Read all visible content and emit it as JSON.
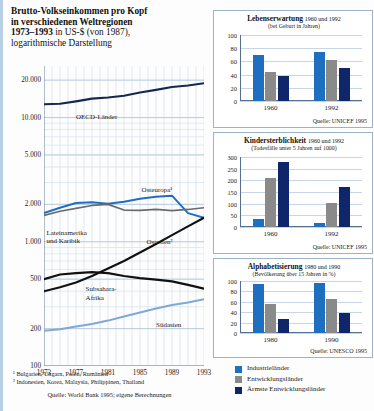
{
  "title": {
    "line1": "Brutto-Volkseinkommen pro Kopf",
    "line2": "in verschiedenen Weltregionen",
    "line3_bold": "1973–1993",
    "line3_rest": " in US-$ (von 1987),",
    "line4": "logarithmische Darstellung"
  },
  "colors": {
    "industrial": "#1f6fc0",
    "developing": "#8a8a8a",
    "poorest": "#10266b",
    "oecd_line": "#16284f",
    "osteuropa_line": "#1f6fc0",
    "ostasien_line": "#111111",
    "lateinamerika_line": "#6b6b6b",
    "subsahara_line": "#111111",
    "suedasien_line": "#7fa8d4",
    "grid": "#c6d6e6",
    "panel_border": "#9bb4cc"
  },
  "main_chart": {
    "type": "line",
    "log_scale": true,
    "ylabel": "",
    "xlabel": "",
    "yticks": [
      "20.000",
      "10.000",
      "5.000",
      "2.000",
      "1.000",
      "500",
      "200",
      "100"
    ],
    "ytick_values": [
      20000,
      10000,
      5000,
      2000,
      1000,
      500,
      200,
      100
    ],
    "ylim": [
      100,
      26000
    ],
    "xticks": [
      "1973",
      "1977",
      "1981",
      "1985",
      "1989",
      "1993"
    ],
    "xtick_values": [
      1973,
      1977,
      1981,
      1985,
      1989,
      1993
    ],
    "xlim": [
      1973,
      1993
    ],
    "series": [
      {
        "name": "OECD-Länder",
        "label": "OECD-Länder",
        "color": "#16284f",
        "width": 2.1,
        "x": [
          1973,
          1975,
          1977,
          1979,
          1981,
          1983,
          1985,
          1987,
          1989,
          1991,
          1993
        ],
        "values": [
          12800,
          12900,
          13500,
          14200,
          14500,
          15000,
          15900,
          16700,
          17600,
          18100,
          18900
        ]
      },
      {
        "name": "Osteuropa",
        "label": "Osteuropa¹",
        "color": "#1f6fc0",
        "width": 2.0,
        "x": [
          1973,
          1975,
          1977,
          1979,
          1981,
          1983,
          1985,
          1987,
          1989,
          1991,
          1993
        ],
        "values": [
          1700,
          1880,
          2050,
          2080,
          2020,
          2100,
          2220,
          2300,
          2350,
          1700,
          1560
        ]
      },
      {
        "name": "Lateinamerika und Karibik",
        "label": "Lateinamerika\nund Karibik",
        "color": "#6b6b6b",
        "width": 1.7,
        "x": [
          1973,
          1975,
          1977,
          1979,
          1981,
          1983,
          1985,
          1987,
          1989,
          1991,
          1993
        ],
        "values": [
          1630,
          1760,
          1860,
          1960,
          2000,
          1800,
          1790,
          1820,
          1780,
          1820,
          1880
        ]
      },
      {
        "name": "Ostasien",
        "label": "Ostasien²",
        "color": "#111111",
        "width": 2.1,
        "x": [
          1973,
          1975,
          1977,
          1979,
          1981,
          1983,
          1985,
          1987,
          1989,
          1991,
          1993
        ],
        "values": [
          400,
          430,
          470,
          530,
          610,
          700,
          820,
          960,
          1130,
          1330,
          1560
        ]
      },
      {
        "name": "Subsahara-Afrika",
        "label": "Subsahara-\nAfrika",
        "color": "#111111",
        "width": 2.2,
        "x": [
          1973,
          1975,
          1977,
          1979,
          1981,
          1983,
          1985,
          1987,
          1989,
          1991,
          1993
        ],
        "values": [
          500,
          545,
          560,
          570,
          560,
          530,
          510,
          495,
          480,
          450,
          420
        ]
      },
      {
        "name": "Südasien",
        "label": "Südasien",
        "color": "#7fa8d4",
        "width": 2.0,
        "x": [
          1973,
          1975,
          1977,
          1979,
          1981,
          1983,
          1985,
          1987,
          1989,
          1991,
          1993
        ],
        "values": [
          192,
          198,
          208,
          218,
          232,
          250,
          270,
          290,
          310,
          325,
          345
        ]
      }
    ],
    "footnotes": [
      "¹ Bulgarien, Ungarn, Polen, Rumänien",
      "² Indonesien, Korea, Malaysia, Philippinen, Thailand"
    ],
    "source": "Quelle: World Bank 1995; eigene Berechnungen"
  },
  "panels": [
    {
      "id": "lebenserwartung",
      "title": "Lebenserwartung",
      "title_years": "1960 und 1992",
      "subtitle": "(bei Geburt in Jahren)",
      "source": "Quelle: UNICEF 1995",
      "chart_data": {
        "type": "bar",
        "title": "Lebenserwartung 1960 und 1992",
        "ylabel": "(bei Geburt in Jahren)",
        "xlabel": "",
        "categories": [
          "1960",
          "1992"
        ],
        "ylim": [
          0,
          100
        ],
        "yticks": [
          0,
          20,
          40,
          60,
          80,
          100
        ],
        "grid": true,
        "legend_position": "bottom",
        "series": [
          {
            "name": "Industrieländer",
            "color": "#1f6fc0",
            "values": [
              69,
              75
            ]
          },
          {
            "name": "Entwicklungsländer",
            "color": "#8a8a8a",
            "values": [
              44,
              62
            ]
          },
          {
            "name": "Ärmste Entwicklungsländer",
            "color": "#10266b",
            "values": [
              38,
              50
            ]
          }
        ]
      }
    },
    {
      "id": "kindersterblichkeit",
      "title": "Kindersterblichkeit",
      "title_years": "1960 und 1992",
      "subtitle": "(Todesfälle unter 5 Jahren auf 1000)",
      "source": "Quelle: UNICEF 1995",
      "chart_data": {
        "type": "bar",
        "title": "Kindersterblichkeit 1960 und 1992",
        "ylabel": "(Todesfälle unter 5 Jahren auf 1000)",
        "xlabel": "",
        "categories": [
          "1960",
          "1992"
        ],
        "ylim": [
          0,
          300
        ],
        "yticks": [
          0,
          50,
          100,
          150,
          200,
          250,
          300
        ],
        "grid": true,
        "legend_position": "bottom",
        "series": [
          {
            "name": "Industrieländer",
            "color": "#1f6fc0",
            "values": [
              35,
              17
            ]
          },
          {
            "name": "Entwicklungsländer",
            "color": "#8a8a8a",
            "values": [
              210,
              103
            ]
          },
          {
            "name": "Ärmste Entwicklungsländer",
            "color": "#10266b",
            "values": [
              280,
              172
            ]
          }
        ]
      }
    },
    {
      "id": "alphabetisierung",
      "title": "Alphabetisierung",
      "title_years": "1980 und 1990",
      "subtitle": "(Bevölkerung über 15 Jahren in %)",
      "source": "Quelle: UNESCO 1995",
      "chart_data": {
        "type": "bar",
        "title": "Alphabetisierung 1980 und 1990",
        "ylabel": "(Bevölkerung über 15 Jahren in %)",
        "xlabel": "",
        "categories": [
          "1980",
          "1990"
        ],
        "ylim": [
          0,
          100
        ],
        "yticks": [
          0,
          20,
          40,
          60,
          80,
          100
        ],
        "grid": true,
        "legend_position": "bottom",
        "series": [
          {
            "name": "Industrieländer",
            "color": "#1f6fc0",
            "values": [
              95,
              97
            ]
          },
          {
            "name": "Entwicklungsländer",
            "color": "#8a8a8a",
            "values": [
              55,
              66
            ]
          },
          {
            "name": "Ärmste Entwicklungsländer",
            "color": "#10266b",
            "values": [
              27,
              39
            ]
          }
        ]
      }
    }
  ],
  "legend": [
    {
      "label": "Industrieländer",
      "color": "#1f6fc0"
    },
    {
      "label": "Entwicklungsländer",
      "color": "#8a8a8a"
    },
    {
      "label": "Ärmste Entwicklungsländer",
      "color": "#10266b"
    }
  ]
}
